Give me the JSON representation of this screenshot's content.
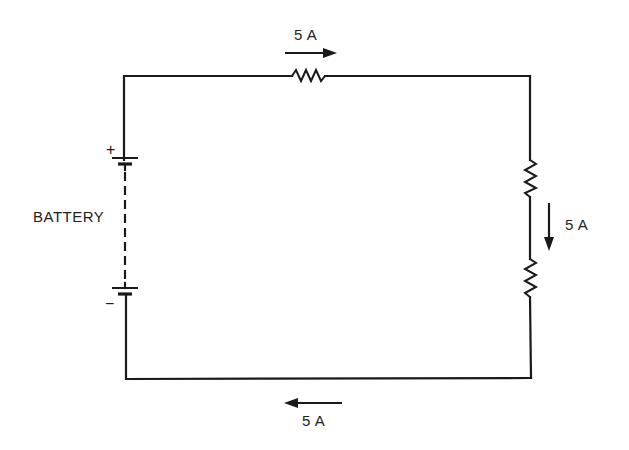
{
  "diagram": {
    "type": "series-circuit",
    "colors": {
      "line": "#1a1a1a",
      "text": "#222222",
      "background": "#ffffff"
    },
    "battery": {
      "label": "BATTERY",
      "positive_sign": "+",
      "negative_sign": "−"
    },
    "resistors": [
      {
        "position": "top"
      },
      {
        "position": "right-upper"
      },
      {
        "position": "right-lower"
      }
    ],
    "currents": {
      "top": {
        "label": "5 A",
        "direction": "right"
      },
      "right": {
        "label": "5 A",
        "direction": "down"
      },
      "bottom": {
        "label": "5 A",
        "direction": "left"
      }
    }
  }
}
